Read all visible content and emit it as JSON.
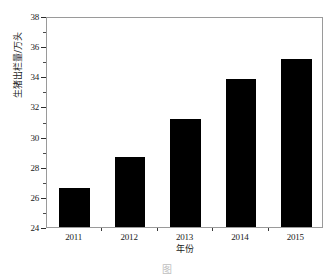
{
  "chart_data": {
    "type": "bar",
    "title": "",
    "categories": [
      "2011",
      "2012",
      "2013",
      "2014",
      "2015"
    ],
    "values": [
      26.6,
      28.65,
      31.2,
      33.85,
      35.15
    ],
    "series": [
      {
        "name": "生猪出栏量",
        "values": [
          26.6,
          28.65,
          31.2,
          33.85,
          35.15
        ]
      }
    ],
    "xlabel": "年份",
    "ylabel": "生猪出栏量/万头",
    "ylim": [
      24,
      38
    ],
    "ytick_labels": [
      "24",
      "26",
      "28",
      "30",
      "32",
      "34",
      "36",
      "38"
    ],
    "ytick_values": [
      24,
      26,
      28,
      30,
      32,
      34,
      36,
      38
    ],
    "yminor_tick_values": [
      25,
      27,
      29,
      31,
      33,
      35,
      37
    ],
    "xtick_labels": [
      "2011",
      "2012",
      "2013",
      "2014",
      "2015"
    ],
    "grid": false,
    "legend": "none",
    "bar_color": "#000000",
    "frame_color": "#9a9a9a",
    "background_color": "#ffffff"
  },
  "axes": {
    "y_title": "生猪出栏量/万头",
    "x_title": "年份"
  },
  "caption": {
    "text": "图"
  }
}
